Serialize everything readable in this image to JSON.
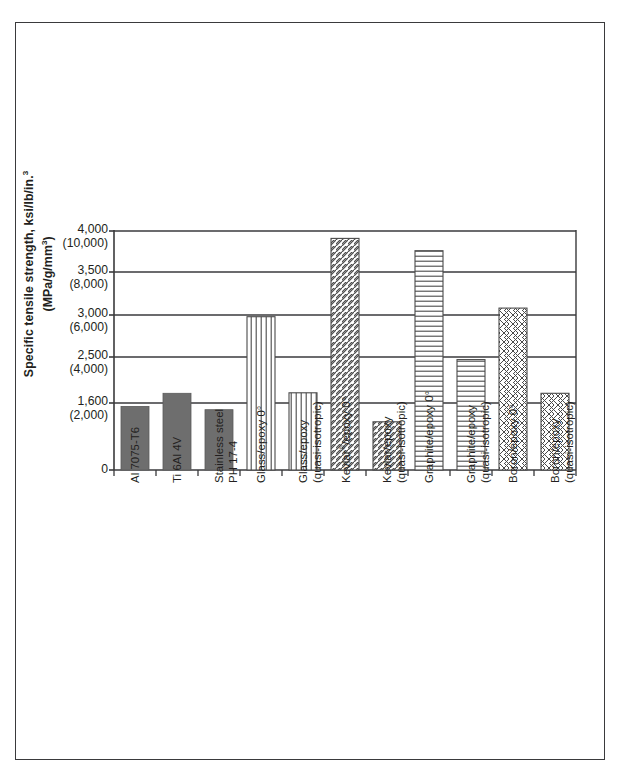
{
  "figure": {
    "background": "#ffffff",
    "border_color": "#3a3a3c"
  },
  "chart_data": {
    "type": "bar",
    "title": "",
    "subtitle": "",
    "xlabel": "",
    "ylabel": "Specific tensile strength, ksi/lb/in.3 (MPa/g/mm3)",
    "ylabel_primary": "Specific tensile strength, ksi/lb/in.",
    "ylabel_primary_sup": "3",
    "ylabel_secondary": "(MPa/g/mm",
    "ylabel_secondary_sup": "3",
    "ylabel_secondary_close": ")",
    "grid": true,
    "legend": "none",
    "y_axis_note": "Dual scale: primary ksi/lb/in.3, secondary (MPa/g/mm3) in parentheses; tick spacing is non-uniform",
    "y_ticks": [
      {
        "primary": "4,000",
        "secondary": "(10,000)",
        "value": 4000,
        "alt_value": 10000
      },
      {
        "primary": "3,500",
        "secondary": "(8,000)",
        "value": 3500,
        "alt_value": 8000
      },
      {
        "primary": "3,000",
        "secondary": "(6,000)",
        "value": 3000,
        "alt_value": 6000
      },
      {
        "primary": "2,500",
        "secondary": "(4,000)",
        "value": 2500,
        "alt_value": 4000
      },
      {
        "primary": "1,600",
        "secondary": "(2,000)",
        "value": 1600,
        "alt_value": 2000
      },
      {
        "primary": "0",
        "secondary": "",
        "value": 0,
        "alt_value": 0
      }
    ],
    "ylim": [
      0,
      4000
    ],
    "categories": [
      "Al 7075-T6",
      "Ti 6Al 4V",
      "Stainless steel PH 17-4",
      "Glass/epoxy 0°",
      "Glass/epoxy (quasi-isotropic)",
      "Kevlar®/epoxy 0°",
      "Kevlar/epoxy (quasi-isotropic)",
      "Graphite/epoxy 0°",
      "Graphite/epoxy (quasi-isotropic)",
      "Boron/epoxy 0°",
      "Boron/epoxy (quasi-isotropic)"
    ],
    "values": [
      1520,
      1790,
      1440,
      2980,
      1800,
      3910,
      1150,
      3760,
      2450,
      3080,
      1790
    ],
    "bars": [
      {
        "label_line1": "Al 7075-T6",
        "label_line2": "",
        "value": 1520,
        "pattern": "solid"
      },
      {
        "label_line1": "Ti 6Al 4V",
        "label_line2": "",
        "value": 1790,
        "pattern": "solid"
      },
      {
        "label_line1": "Stainless steel",
        "label_line2": "PH 17-4",
        "value": 1440,
        "pattern": "solid"
      },
      {
        "label_line1": "Glass/epoxy 0°",
        "label_line2": "",
        "value": 2980,
        "pattern": "vertical"
      },
      {
        "label_line1": "Glass/epoxy",
        "label_line2": "(quasi-isotropic)",
        "value": 1800,
        "pattern": "vertical"
      },
      {
        "label_line1": "Kevlar®/epoxy 0°",
        "label_line2": "",
        "value": 3910,
        "pattern": "diagonal"
      },
      {
        "label_line1": "Kevlar/epoxy",
        "label_line2": "(quasi-isotropic)",
        "value": 1150,
        "pattern": "diagonal"
      },
      {
        "label_line1": "Graphite/epoxy 0°",
        "label_line2": "",
        "value": 3760,
        "pattern": "horizontal"
      },
      {
        "label_line1": "Graphite/epoxy",
        "label_line2": "(quasi-isotropic)",
        "value": 2450,
        "pattern": "horizontal"
      },
      {
        "label_line1": "Boron/epoxy 0°",
        "label_line2": "",
        "value": 3080,
        "pattern": "crosshatch"
      },
      {
        "label_line1": "Boron/epoxy",
        "label_line2": "(quasi-isotropic)",
        "value": 1790,
        "pattern": "crosshatch"
      }
    ],
    "colors": {
      "solid_fill": "#6e6e6e",
      "pattern_fill": "#ffffff",
      "pattern_stroke": "#4a4a4a",
      "axis": "#3a3a3c",
      "grid": "#3a3a3c",
      "text": "#231f20"
    }
  }
}
